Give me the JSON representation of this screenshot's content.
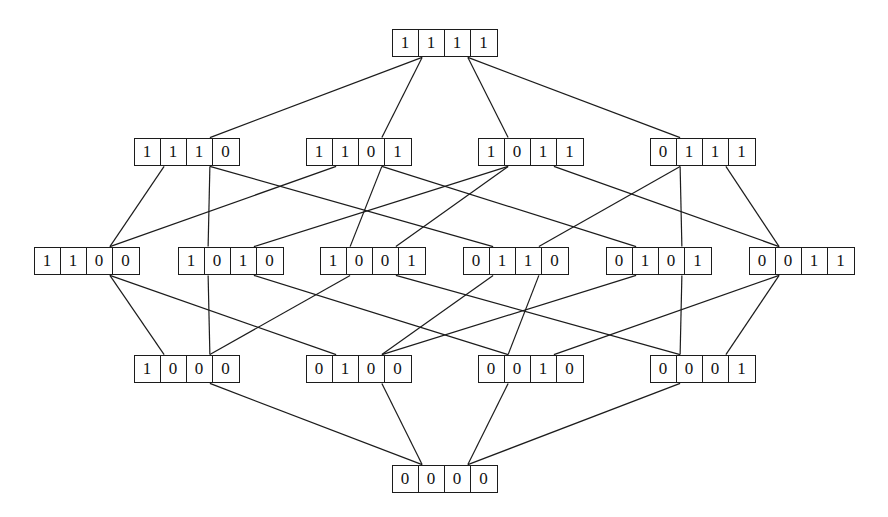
{
  "figure": {
    "kind": "hasse-diagram",
    "title": "",
    "background_color": "#ffffff",
    "line_color": "#1c1c1c",
    "text_color": "#111111",
    "width": 888,
    "height": 517
  },
  "chart_data": {
    "type": "diagram",
    "title": "",
    "xlabel": "",
    "ylabel": "",
    "ranks": [
      {
        "rank": 4,
        "labels": [
          "1111"
        ]
      },
      {
        "rank": 3,
        "labels": [
          "1110",
          "1101",
          "1011",
          "0111"
        ]
      },
      {
        "rank": 2,
        "labels": [
          "1100",
          "1010",
          "1001",
          "0110",
          "0101",
          "0011"
        ]
      },
      {
        "rank": 1,
        "labels": [
          "1000",
          "0100",
          "0010",
          "0001"
        ]
      },
      {
        "rank": 0,
        "labels": [
          "0000"
        ]
      }
    ],
    "nodes": [
      {
        "id": "1111",
        "label": "1111",
        "bits": [
          "1",
          "1",
          "1",
          "1"
        ],
        "x": 445,
        "y": 43
      },
      {
        "id": "1110",
        "label": "1110",
        "bits": [
          "1",
          "1",
          "1",
          "0"
        ],
        "x": 187,
        "y": 152
      },
      {
        "id": "1101",
        "label": "1101",
        "bits": [
          "1",
          "1",
          "0",
          "1"
        ],
        "x": 359,
        "y": 152
      },
      {
        "id": "1011",
        "label": "1011",
        "bits": [
          "1",
          "0",
          "1",
          "1"
        ],
        "x": 531,
        "y": 152
      },
      {
        "id": "0111",
        "label": "0111",
        "bits": [
          "0",
          "1",
          "1",
          "1"
        ],
        "x": 703,
        "y": 152
      },
      {
        "id": "1100",
        "label": "1100",
        "bits": [
          "1",
          "1",
          "0",
          "0"
        ],
        "x": 87,
        "y": 261
      },
      {
        "id": "1010",
        "label": "1010",
        "bits": [
          "1",
          "0",
          "1",
          "0"
        ],
        "x": 231,
        "y": 261
      },
      {
        "id": "1001",
        "label": "1001",
        "bits": [
          "1",
          "0",
          "0",
          "1"
        ],
        "x": 373,
        "y": 261
      },
      {
        "id": "0110",
        "label": "0110",
        "bits": [
          "0",
          "1",
          "1",
          "0"
        ],
        "x": 516,
        "y": 261
      },
      {
        "id": "0101",
        "label": "0101",
        "bits": [
          "0",
          "1",
          "0",
          "1"
        ],
        "x": 659,
        "y": 261
      },
      {
        "id": "0011",
        "label": "0011",
        "bits": [
          "0",
          "0",
          "1",
          "1"
        ],
        "x": 802,
        "y": 261
      },
      {
        "id": "1000",
        "label": "1000",
        "bits": [
          "1",
          "0",
          "0",
          "0"
        ],
        "x": 187,
        "y": 369
      },
      {
        "id": "0100",
        "label": "0100",
        "bits": [
          "0",
          "1",
          "0",
          "0"
        ],
        "x": 359,
        "y": 369
      },
      {
        "id": "0010",
        "label": "0010",
        "bits": [
          "0",
          "0",
          "1",
          "0"
        ],
        "x": 531,
        "y": 369
      },
      {
        "id": "0001",
        "label": "0001",
        "bits": [
          "0",
          "0",
          "0",
          "1"
        ],
        "x": 703,
        "y": 369
      },
      {
        "id": "0000",
        "label": "0000",
        "bits": [
          "0",
          "0",
          "0",
          "0"
        ],
        "x": 445,
        "y": 479
      }
    ],
    "edges": [
      [
        "1111",
        "1110"
      ],
      [
        "1111",
        "1101"
      ],
      [
        "1111",
        "1011"
      ],
      [
        "1111",
        "0111"
      ],
      [
        "1110",
        "1100"
      ],
      [
        "1110",
        "1010"
      ],
      [
        "1110",
        "0110"
      ],
      [
        "1101",
        "1100"
      ],
      [
        "1101",
        "1001"
      ],
      [
        "1101",
        "0101"
      ],
      [
        "1011",
        "1010"
      ],
      [
        "1011",
        "1001"
      ],
      [
        "1011",
        "0011"
      ],
      [
        "0111",
        "0110"
      ],
      [
        "0111",
        "0101"
      ],
      [
        "0111",
        "0011"
      ],
      [
        "1100",
        "1000"
      ],
      [
        "1100",
        "0100"
      ],
      [
        "1010",
        "1000"
      ],
      [
        "1010",
        "0010"
      ],
      [
        "1001",
        "1000"
      ],
      [
        "1001",
        "0001"
      ],
      [
        "0110",
        "0100"
      ],
      [
        "0110",
        "0010"
      ],
      [
        "0101",
        "0100"
      ],
      [
        "0101",
        "0001"
      ],
      [
        "0011",
        "0010"
      ],
      [
        "0011",
        "0001"
      ],
      [
        "1000",
        "0000"
      ],
      [
        "0100",
        "0000"
      ],
      [
        "0010",
        "0000"
      ],
      [
        "0001",
        "0000"
      ]
    ]
  }
}
